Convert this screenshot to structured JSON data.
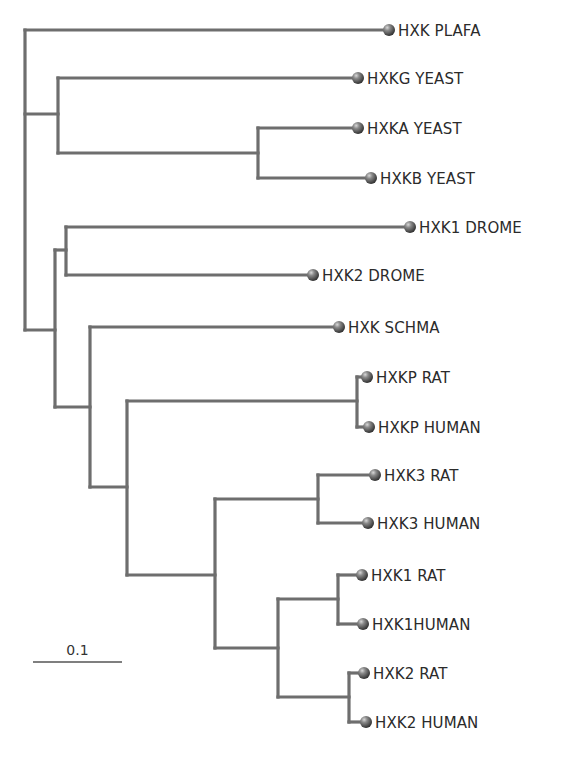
{
  "diagram": {
    "type": "phylogenetic-tree",
    "colors": {
      "branch": "#6e6e6e",
      "node_ball": "#5a5a5a",
      "label": "#2b2b2b",
      "background": "#ffffff"
    },
    "scale_bar": {
      "label": "0.1",
      "x1": 33,
      "x2": 122,
      "y": 662
    },
    "leaves": [
      {
        "id": "hxk-plafa",
        "label": "HXK PLAFA",
        "x": 389,
        "y": 30
      },
      {
        "id": "hxkg-yeast",
        "label": "HXKG YEAST",
        "x": 358,
        "y": 78
      },
      {
        "id": "hxka-yeast",
        "label": "HXKA YEAST",
        "x": 358,
        "y": 128
      },
      {
        "id": "hxkb-yeast",
        "label": "HXKB YEAST",
        "x": 371,
        "y": 178
      },
      {
        "id": "hxk1-drome",
        "label": "HXK1 DROME",
        "x": 410,
        "y": 227
      },
      {
        "id": "hxk2-drome",
        "label": "HXK2 DROME",
        "x": 313,
        "y": 275
      },
      {
        "id": "hxk-schma",
        "label": "HXK SCHMA",
        "x": 339,
        "y": 327
      },
      {
        "id": "hxkp-rat",
        "label": "HXKP RAT",
        "x": 367,
        "y": 377
      },
      {
        "id": "hxkp-human",
        "label": "HXKP HUMAN",
        "x": 369,
        "y": 427
      },
      {
        "id": "hxk3-rat",
        "label": "HXK3 RAT",
        "x": 375,
        "y": 475
      },
      {
        "id": "hxk3-human",
        "label": "HXK3 HUMAN",
        "x": 368,
        "y": 523
      },
      {
        "id": "hxk1-rat",
        "label": "HXK1 RAT",
        "x": 362,
        "y": 575
      },
      {
        "id": "hxk1-human",
        "label": "HXK1HUMAN",
        "x": 363,
        "y": 624
      },
      {
        "id": "hxk2-rat",
        "label": "HXK2 RAT",
        "x": 364,
        "y": 673
      },
      {
        "id": "hxk2-human",
        "label": "HXK2 HUMAN",
        "x": 366,
        "y": 722
      }
    ],
    "branches": [
      [
        25,
        30,
        389,
        30
      ],
      [
        25,
        30,
        25,
        330
      ],
      [
        25,
        114,
        58,
        114
      ],
      [
        58,
        78,
        58,
        153
      ],
      [
        58,
        78,
        358,
        78
      ],
      [
        58,
        153,
        258,
        153
      ],
      [
        258,
        128,
        258,
        178
      ],
      [
        258,
        128,
        358,
        128
      ],
      [
        258,
        178,
        371,
        178
      ],
      [
        25,
        330,
        55,
        330
      ],
      [
        55,
        250,
        55,
        407
      ],
      [
        55,
        250,
        66,
        250
      ],
      [
        66,
        227,
        66,
        275
      ],
      [
        66,
        227,
        410,
        227
      ],
      [
        66,
        275,
        313,
        275
      ],
      [
        55,
        407,
        90,
        407
      ],
      [
        90,
        327,
        90,
        487
      ],
      [
        90,
        327,
        339,
        327
      ],
      [
        90,
        487,
        127,
        487
      ],
      [
        127,
        401,
        127,
        575
      ],
      [
        127,
        401,
        357,
        401
      ],
      [
        357,
        377,
        357,
        427
      ],
      [
        357,
        377,
        367,
        377
      ],
      [
        357,
        427,
        369,
        427
      ],
      [
        127,
        575,
        215,
        575
      ],
      [
        215,
        499,
        215,
        648
      ],
      [
        215,
        499,
        318,
        499
      ],
      [
        318,
        475,
        318,
        523
      ],
      [
        318,
        475,
        375,
        475
      ],
      [
        318,
        523,
        368,
        523
      ],
      [
        215,
        648,
        278,
        648
      ],
      [
        278,
        599,
        278,
        697
      ],
      [
        278,
        599,
        338,
        599
      ],
      [
        338,
        575,
        338,
        624
      ],
      [
        338,
        575,
        362,
        575
      ],
      [
        338,
        624,
        363,
        624
      ],
      [
        278,
        697,
        349,
        697
      ],
      [
        349,
        673,
        349,
        722
      ],
      [
        349,
        673,
        364,
        673
      ],
      [
        349,
        722,
        366,
        722
      ]
    ]
  }
}
